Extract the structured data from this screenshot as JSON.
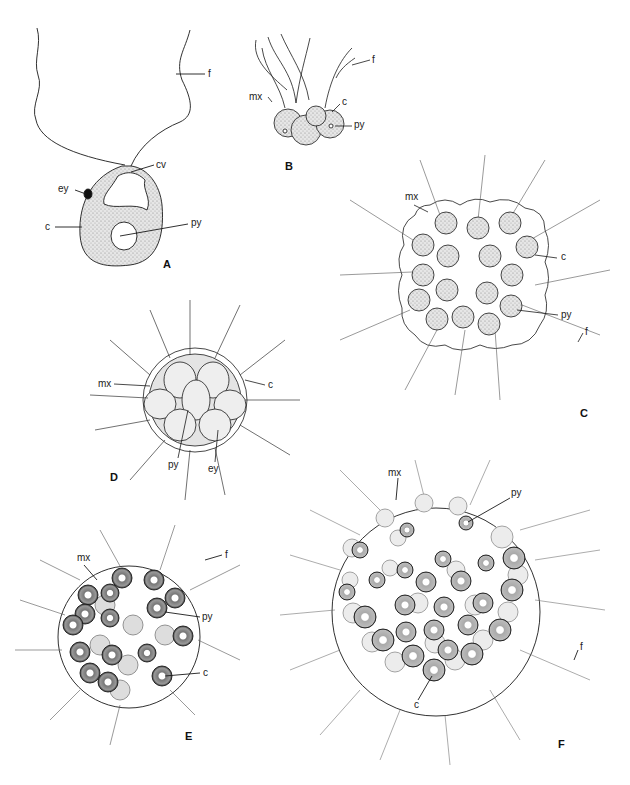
{
  "figure": {
    "panels": [
      {
        "id": "A",
        "label": "A",
        "description": "single biflagellate cell",
        "callouts": [
          "f",
          "cv",
          "ey",
          "c",
          "py"
        ]
      },
      {
        "id": "B",
        "label": "B",
        "description": "small cluster of four cells",
        "callouts": [
          "f",
          "mx",
          "c",
          "py"
        ]
      },
      {
        "id": "C",
        "label": "C",
        "description": "16-celled flattened colony with lobed matrix",
        "callouts": [
          "mx",
          "c",
          "py",
          "f"
        ]
      },
      {
        "id": "D",
        "label": "D",
        "description": "compact spherical colony of tightly packed cells",
        "callouts": [
          "mx",
          "c",
          "py",
          "ey"
        ]
      },
      {
        "id": "E",
        "label": "E",
        "description": "spherical colony with scattered cells",
        "callouts": [
          "mx",
          "f",
          "py",
          "c"
        ]
      },
      {
        "id": "F",
        "label": "F",
        "description": "large spherical colony with many cells",
        "callouts": [
          "mx",
          "py",
          "f",
          "c"
        ]
      }
    ],
    "abbreviations": {
      "f": "flagellum",
      "cv": "contractile vacuole",
      "ey": "eyespot",
      "c": "chloroplast",
      "py": "pyrenoid",
      "mx": "matrix"
    },
    "colors": {
      "ink": "#1a1a1a",
      "background": "#ffffff",
      "cell_fill": "#d8d8d8",
      "dark_cell": "#555555"
    }
  }
}
